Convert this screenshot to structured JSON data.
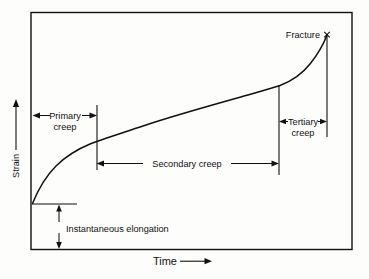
{
  "figure": {
    "axes": {
      "y_label": "Strain",
      "x_label": "Time",
      "y_arrow_icon": "up-arrow-icon",
      "x_arrow_icon": "right-arrow-icon"
    },
    "annotations": {
      "primary_creep": "Primary",
      "primary_creep_line2": "creep",
      "secondary_creep": "Secondary creep",
      "tertiary_creep": "Tertiary",
      "tertiary_creep_line2": "creep",
      "instantaneous_elongation": "Instantaneous elongation",
      "fracture": "Fracture",
      "fracture_marker": "×"
    },
    "colors": {
      "ink": "#111111",
      "background": "#fdfdfc",
      "frame": "#111111"
    }
  },
  "chart_data": {
    "type": "line",
    "xlabel": "Time",
    "ylabel": "Strain",
    "xlim": [
      0,
      100
    ],
    "ylim": [
      0,
      100
    ],
    "grid": false,
    "legend": "none",
    "series": [
      {
        "name": "Creep strain",
        "x": [
          0,
          2,
          4,
          7,
          10,
          14,
          18,
          22,
          27,
          32,
          38,
          45,
          52,
          58,
          64,
          70,
          76,
          80,
          83,
          86,
          88,
          90,
          92,
          94,
          96,
          97,
          98,
          99,
          100
        ],
        "y": [
          17,
          26,
          32,
          38,
          42,
          46,
          49,
          51,
          54,
          56,
          58,
          61,
          64,
          66,
          68,
          70,
          72,
          74,
          75,
          77,
          79,
          81,
          84,
          88,
          93,
          96,
          98,
          100,
          101
        ]
      }
    ],
    "regions": [
      {
        "name": "Primary creep",
        "x_start": 0,
        "x_end": 20,
        "label": "Primary creep"
      },
      {
        "name": "Secondary creep",
        "x_start": 20,
        "x_end": 77,
        "label": "Secondary creep"
      },
      {
        "name": "Tertiary creep",
        "x_start": 77,
        "x_end": 100,
        "label": "Tertiary creep"
      }
    ],
    "annotations": [
      {
        "name": "instantaneous-elongation",
        "label": "Instantaneous elongation",
        "x": 0,
        "y_from": 0,
        "y_to": 17
      },
      {
        "name": "fracture",
        "label": "Fracture",
        "x": 100,
        "y": 101,
        "marker": "×"
      }
    ]
  }
}
